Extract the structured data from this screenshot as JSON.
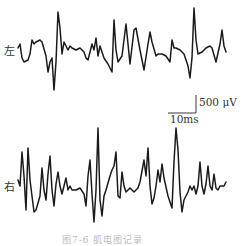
{
  "chart_data": {
    "type": "line",
    "title": "",
    "caption": "图7-6 肌电图记录",
    "xlabel": "",
    "ylabel": "",
    "grid": false,
    "scale_bar": {
      "amplitude": "500 μV",
      "time": "10ms"
    },
    "series": [
      {
        "name": "左",
        "description": "Left-channel EMG trace, baseline ~y=50px, sharp spikes up to ~-40 px and down to ~+45 px",
        "points": [
          [
            18,
            48
          ],
          [
            20,
            44
          ],
          [
            22,
            58
          ],
          [
            24,
            62
          ],
          [
            28,
            60
          ],
          [
            30,
            54
          ],
          [
            32,
            40
          ],
          [
            34,
            44
          ],
          [
            36,
            42
          ],
          [
            40,
            40
          ],
          [
            42,
            42
          ],
          [
            46,
            56
          ],
          [
            48,
            72
          ],
          [
            50,
            62
          ],
          [
            52,
            58
          ],
          [
            54,
            90
          ],
          [
            56,
            62
          ],
          [
            58,
            12
          ],
          [
            60,
            28
          ],
          [
            62,
            54
          ],
          [
            64,
            42
          ],
          [
            66,
            46
          ],
          [
            68,
            50
          ],
          [
            70,
            46
          ],
          [
            72,
            48
          ],
          [
            76,
            50
          ],
          [
            80,
            48
          ],
          [
            84,
            52
          ],
          [
            86,
            58
          ],
          [
            88,
            60
          ],
          [
            90,
            52
          ],
          [
            92,
            44
          ],
          [
            94,
            50
          ],
          [
            96,
            38
          ],
          [
            98,
            56
          ],
          [
            100,
            46
          ],
          [
            104,
            58
          ],
          [
            108,
            64
          ],
          [
            112,
            72
          ],
          [
            114,
            20
          ],
          [
            116,
            50
          ],
          [
            118,
            62
          ],
          [
            122,
            56
          ],
          [
            126,
            24
          ],
          [
            128,
            44
          ],
          [
            130,
            64
          ],
          [
            134,
            30
          ],
          [
            136,
            28
          ],
          [
            140,
            50
          ],
          [
            144,
            70
          ],
          [
            148,
            44
          ],
          [
            150,
            32
          ],
          [
            152,
            42
          ],
          [
            156,
            56
          ],
          [
            158,
            54
          ],
          [
            162,
            54
          ],
          [
            166,
            56
          ],
          [
            170,
            62
          ],
          [
            172,
            40
          ],
          [
            174,
            48
          ],
          [
            176,
            48
          ],
          [
            180,
            50
          ],
          [
            184,
            54
          ],
          [
            188,
            66
          ],
          [
            190,
            78
          ],
          [
            192,
            58
          ],
          [
            194,
            8
          ],
          [
            196,
            40
          ],
          [
            198,
            54
          ],
          [
            202,
            52
          ],
          [
            206,
            48
          ],
          [
            210,
            46
          ],
          [
            212,
            48
          ],
          [
            216,
            62
          ],
          [
            220,
            44
          ],
          [
            222,
            30
          ],
          [
            224,
            46
          ],
          [
            226,
            52
          ]
        ]
      },
      {
        "name": "右",
        "description": "Right-channel EMG trace, baseline ~y=185px, denser high-amplitude oscillation",
        "points": [
          [
            18,
            180
          ],
          [
            20,
            186
          ],
          [
            22,
            152
          ],
          [
            24,
            176
          ],
          [
            26,
            210
          ],
          [
            28,
            148
          ],
          [
            30,
            180
          ],
          [
            34,
            212
          ],
          [
            36,
            210
          ],
          [
            40,
            196
          ],
          [
            42,
            168
          ],
          [
            44,
            190
          ],
          [
            46,
            200
          ],
          [
            48,
            174
          ],
          [
            50,
            156
          ],
          [
            52,
            190
          ],
          [
            54,
            206
          ],
          [
            56,
            184
          ],
          [
            58,
            172
          ],
          [
            60,
            186
          ],
          [
            62,
            194
          ],
          [
            66,
            178
          ],
          [
            68,
            190
          ],
          [
            70,
            186
          ],
          [
            72,
            190
          ],
          [
            76,
            190
          ],
          [
            80,
            188
          ],
          [
            84,
            194
          ],
          [
            86,
            206
          ],
          [
            88,
            176
          ],
          [
            90,
            160
          ],
          [
            92,
            194
          ],
          [
            94,
            222
          ],
          [
            96,
            190
          ],
          [
            98,
            128
          ],
          [
            100,
            200
          ],
          [
            102,
            216
          ],
          [
            104,
            196
          ],
          [
            106,
            190
          ],
          [
            110,
            176
          ],
          [
            112,
            170
          ],
          [
            114,
            166
          ],
          [
            116,
            152
          ],
          [
            118,
            196
          ],
          [
            120,
            198
          ],
          [
            122,
            172
          ],
          [
            124,
            186
          ],
          [
            126,
            192
          ],
          [
            130,
            188
          ],
          [
            134,
            192
          ],
          [
            138,
            188
          ],
          [
            140,
            182
          ],
          [
            144,
            160
          ],
          [
            146,
            176
          ],
          [
            148,
            148
          ],
          [
            150,
            186
          ],
          [
            152,
            204
          ],
          [
            154,
            198
          ],
          [
            156,
            186
          ],
          [
            158,
            170
          ],
          [
            160,
            182
          ],
          [
            162,
            164
          ],
          [
            164,
            178
          ],
          [
            168,
            196
          ],
          [
            172,
            208
          ],
          [
            174,
            162
          ],
          [
            176,
            128
          ],
          [
            178,
            150
          ],
          [
            180,
            192
          ],
          [
            182,
            212
          ],
          [
            184,
            200
          ],
          [
            186,
            196
          ],
          [
            188,
            192
          ],
          [
            190,
            186
          ],
          [
            192,
            190
          ],
          [
            194,
            186
          ],
          [
            196,
            194
          ],
          [
            198,
            186
          ],
          [
            200,
            162
          ],
          [
            202,
            186
          ],
          [
            204,
            194
          ],
          [
            206,
            184
          ],
          [
            208,
            166
          ],
          [
            210,
            186
          ],
          [
            212,
            190
          ],
          [
            214,
            174
          ],
          [
            216,
            188
          ],
          [
            218,
            190
          ],
          [
            220,
            186
          ],
          [
            224,
            186
          ],
          [
            226,
            182
          ]
        ]
      }
    ]
  },
  "labels": {
    "left_channel": "左",
    "right_channel": "右",
    "amplitude_scale": "500 μV",
    "time_scale": "10ms",
    "caption": "图7-6 肌电图记录"
  }
}
